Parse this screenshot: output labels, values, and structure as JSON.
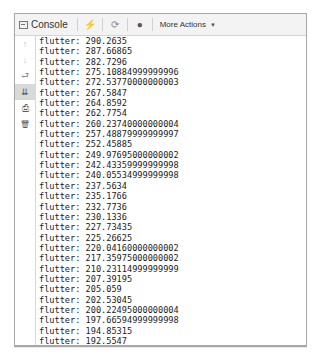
{
  "toolbar": {
    "console_tab_label": "Console",
    "more_actions_label": "More Actions",
    "icons": {
      "console": "console-icon",
      "flash": "lightning-icon",
      "reload": "reload-icon",
      "mask": "device-icon",
      "caret": "caret-down-icon"
    },
    "glyphs": {
      "flash": "⚡",
      "reload": "⟳",
      "mask": "●",
      "caret": "▼"
    }
  },
  "sidebar": {
    "items": [
      {
        "name": "scroll-up",
        "glyph": "↑"
      },
      {
        "name": "scroll-down",
        "glyph": "↓"
      },
      {
        "name": "soft-wrap",
        "glyph": "⮐"
      },
      {
        "name": "scroll-to-end",
        "glyph": "⇊"
      },
      {
        "name": "print",
        "glyph": "⎙"
      },
      {
        "name": "clear-all",
        "glyph": "🗑"
      }
    ]
  },
  "log": {
    "prefix": "flutter:",
    "lines": [
      "flutter: 290.2635",
      "flutter: 287.66865",
      "flutter: 282.7296",
      "flutter: 275.10884999999996",
      "flutter: 272.53770000000003",
      "flutter: 267.5847",
      "flutter: 264.8592",
      "flutter: 262.7754",
      "flutter: 260.23740000000004",
      "flutter: 257.48879999999997",
      "flutter: 252.45885",
      "flutter: 249.97695000000002",
      "flutter: 242.43359999999998",
      "flutter: 240.05534999999998",
      "flutter: 237.5634",
      "flutter: 235.1766",
      "flutter: 232.7736",
      "flutter: 230.1336",
      "flutter: 227.73435",
      "flutter: 225.26625",
      "flutter: 220.04160000000002",
      "flutter: 217.35975000000002",
      "flutter: 210.23114999999999",
      "flutter: 207.39195",
      "flutter: 205.059",
      "flutter: 202.53045",
      "flutter: 200.22495000000004",
      "flutter: 197.66594999999998",
      "flutter: 194.85315",
      "flutter: 192.5547"
    ]
  }
}
